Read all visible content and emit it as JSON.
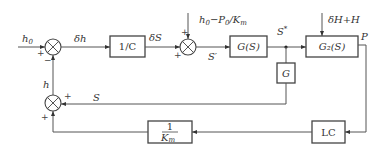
{
  "diagram": {
    "type": "control-block-diagram",
    "blocks": {
      "inv_c": "1/C",
      "gs": "G(S)",
      "g2s": "G₂(S)",
      "g": "G",
      "lc": "LC",
      "inv_km_num": "1",
      "inv_km_den": "K",
      "inv_km_den_sub": "m"
    },
    "signals": {
      "input": "h",
      "input_sub": "0",
      "delta_h": "δh",
      "delta_s": "δS",
      "s_prime": "S′",
      "s_star": "S",
      "s_star_sup": "*",
      "disturbance1": "h",
      "disturbance1_sub": "0",
      "disturbance1_rest": "−P",
      "disturbance1_sub2": "0",
      "disturbance1_tail": "/K",
      "disturbance1_sub3": "m",
      "disturbance2": "δH+H",
      "output": "P",
      "feedback_s": "S",
      "feedback_h": "h"
    },
    "signs": {
      "sum1_left": "+",
      "sum1_bottom": "−",
      "sum2_top": "+",
      "sum2_left": "+",
      "sum3_right": "+",
      "sum3_bottom": "+"
    }
  }
}
